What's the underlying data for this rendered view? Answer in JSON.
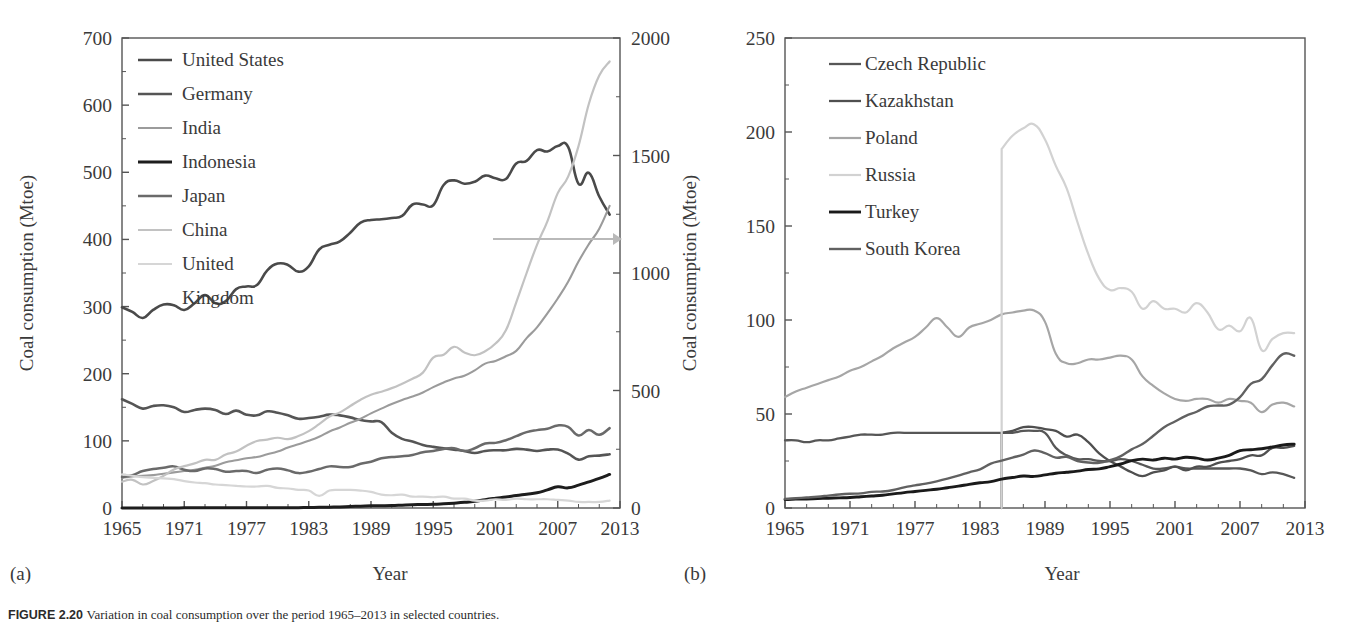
{
  "figure": {
    "caption_label": "FIGURE 2.20",
    "caption_text": "Variation in coal consumption over the period 1965–2013 in selected countries."
  },
  "panels": [
    {
      "id": "a",
      "letter": "(a)",
      "ylabel": "Coal consumption (Mtoe)",
      "xlabel": "Year",
      "y_ticks": [
        "0",
        "100",
        "200",
        "300",
        "400",
        "500",
        "600",
        "700"
      ],
      "y2_ticks": [
        "0",
        "500",
        "1000",
        "1500",
        "2000"
      ],
      "x_ticks": [
        "1965",
        "1971",
        "1977",
        "1983",
        "1989",
        "1995",
        "2001",
        "2007",
        "2013"
      ],
      "secondary_axis_arrow": "right-axis-arrow"
    },
    {
      "id": "b",
      "letter": "(b)",
      "ylabel": "Coal consumption (Mtoe)",
      "xlabel": "Year",
      "y_ticks": [
        "0",
        "50",
        "100",
        "150",
        "200",
        "250"
      ],
      "x_ticks": [
        "1965",
        "1971",
        "1977",
        "1983",
        "1989",
        "1995",
        "2001",
        "2007",
        "2013"
      ]
    }
  ],
  "chart_data": [
    {
      "type": "line",
      "panel": "a",
      "title": "",
      "xlabel": "Year",
      "ylabel": "Coal consumption (Mtoe)",
      "ylabel_secondary": "Coal consumption (Mtoe)",
      "xlim": [
        1965,
        2013
      ],
      "ylim": [
        0,
        700
      ],
      "ylim_secondary": [
        0,
        2000
      ],
      "y_ticks": [
        0,
        100,
        200,
        300,
        400,
        500,
        600,
        700
      ],
      "y2_ticks": [
        0,
        500,
        1000,
        1500,
        2000
      ],
      "x_ticks": [
        1965,
        1971,
        1977,
        1983,
        1989,
        1995,
        2001,
        2007,
        2013
      ],
      "grid": false,
      "legend_position": "upper-left",
      "annotation": {
        "text": "arrow to right axis",
        "y_left": 400,
        "x_from": 1994,
        "x_to": 2013
      },
      "x": [
        1965,
        1966,
        1967,
        1968,
        1969,
        1970,
        1971,
        1972,
        1973,
        1974,
        1975,
        1976,
        1977,
        1978,
        1979,
        1980,
        1981,
        1982,
        1983,
        1984,
        1985,
        1986,
        1987,
        1988,
        1989,
        1990,
        1991,
        1992,
        1993,
        1994,
        1995,
        1996,
        1997,
        1998,
        1999,
        2000,
        2001,
        2002,
        2003,
        2004,
        2005,
        2006,
        2007,
        2008,
        2009,
        2010,
        2011,
        2012
      ],
      "series": [
        {
          "name": "United States",
          "axis": "left",
          "color": "#4a4a4a",
          "width": 2.6,
          "values": [
            299,
            292,
            283,
            295,
            303,
            302,
            295,
            305,
            317,
            305,
            308,
            326,
            330,
            332,
            354,
            364,
            362,
            352,
            360,
            385,
            392,
            397,
            410,
            425,
            429,
            430,
            432,
            435,
            452,
            452,
            451,
            481,
            488,
            483,
            486,
            495,
            491,
            490,
            513,
            517,
            533,
            531,
            539,
            538,
            483,
            499,
            464,
            437
          ]
        },
        {
          "name": "Germany",
          "axis": "left",
          "color": "#555555",
          "width": 2.6,
          "values": [
            162,
            155,
            148,
            152,
            153,
            150,
            143,
            146,
            148,
            146,
            140,
            145,
            139,
            138,
            144,
            142,
            138,
            133,
            134,
            136,
            139,
            138,
            135,
            131,
            129,
            128,
            112,
            103,
            99,
            94,
            91,
            89,
            87,
            85,
            82,
            85,
            86,
            86,
            88,
            87,
            85,
            87,
            87,
            81,
            72,
            77,
            78,
            80
          ]
        },
        {
          "name": "India",
          "axis": "left",
          "color": "#9b9b9b",
          "width": 2.1,
          "values": [
            45,
            47,
            48,
            49,
            51,
            53,
            55,
            57,
            60,
            63,
            68,
            71,
            74,
            76,
            80,
            84,
            90,
            95,
            100,
            106,
            114,
            120,
            127,
            133,
            141,
            148,
            155,
            161,
            166,
            172,
            180,
            187,
            193,
            197,
            205,
            215,
            219,
            226,
            234,
            253,
            269,
            290,
            312,
            337,
            367,
            393,
            416,
            450
          ]
        },
        {
          "name": "Indonesia",
          "axis": "left",
          "color": "#1d1d1d",
          "width": 3.0,
          "values": [
            0.1,
            0.1,
            0.1,
            0.1,
            0.1,
            0.1,
            0.2,
            0.2,
            0.2,
            0.2,
            0.2,
            0.2,
            0.3,
            0.3,
            0.3,
            0.4,
            0.4,
            0.5,
            0.7,
            1.0,
            1.3,
            1.6,
            2.2,
            2.7,
            3.3,
            3.4,
            3.6,
            4.2,
            4.8,
            5.2,
            5.4,
            6.2,
            7.2,
            8.4,
            10.0,
            12.5,
            14.5,
            16.3,
            18.5,
            20.5,
            22.6,
            27.0,
            31.5,
            30.0,
            34.0,
            39.0,
            44.0,
            50.0
          ]
        },
        {
          "name": "Japan",
          "axis": "left",
          "color": "#6a6a6a",
          "width": 2.5,
          "values": [
            46,
            49,
            55,
            58,
            60,
            62,
            57,
            55,
            59,
            58,
            54,
            55,
            55,
            52,
            57,
            59,
            56,
            52,
            54,
            58,
            62,
            61,
            61,
            66,
            69,
            74,
            76,
            77,
            79,
            83,
            85,
            88,
            89,
            85,
            89,
            96,
            97,
            101,
            107,
            113,
            116,
            118,
            123,
            121,
            108,
            116,
            109,
            119
          ]
        },
        {
          "name": "China",
          "axis": "right",
          "color": "#c2c2c2",
          "width": 2.2,
          "values": [
            112,
            120,
            100,
            115,
            137,
            164,
            178,
            190,
            205,
            205,
            228,
            240,
            265,
            285,
            291,
            299,
            293,
            306,
            327,
            357,
            389,
            407,
            434,
            461,
            482,
            495,
            510,
            529,
            550,
            576,
            640,
            652,
            686,
            662,
            650,
            667,
            700,
            756,
            875,
            1000,
            1120,
            1220,
            1340,
            1410,
            1540,
            1720,
            1840,
            1900
          ]
        },
        {
          "name": "United Kingdom",
          "axis": "left",
          "color": "#d6d6d6",
          "width": 2.2,
          "values": [
            50,
            48,
            46,
            45,
            44,
            43,
            40,
            38,
            37,
            35,
            34,
            33,
            32,
            32,
            33,
            30,
            29,
            27,
            26,
            18,
            26,
            27,
            27,
            26,
            24,
            20,
            19,
            20,
            17,
            17,
            16,
            17,
            14,
            14,
            11,
            11,
            13,
            12,
            14,
            13,
            13,
            13,
            12,
            11,
            9,
            9,
            9,
            11
          ]
        }
      ]
    },
    {
      "type": "line",
      "panel": "b",
      "title": "",
      "xlabel": "Year",
      "ylabel": "Coal consumption (Mtoe)",
      "xlim": [
        1965,
        2013
      ],
      "ylim": [
        0,
        250
      ],
      "y_ticks": [
        0,
        50,
        100,
        150,
        200,
        250
      ],
      "x_ticks": [
        1965,
        1971,
        1977,
        1983,
        1989,
        1995,
        2001,
        2007,
        2013
      ],
      "grid": false,
      "legend_position": "upper-left",
      "x": [
        1965,
        1966,
        1967,
        1968,
        1969,
        1970,
        1971,
        1972,
        1973,
        1974,
        1975,
        1976,
        1977,
        1978,
        1979,
        1980,
        1981,
        1982,
        1983,
        1984,
        1985,
        1986,
        1987,
        1988,
        1989,
        1990,
        1991,
        1992,
        1993,
        1994,
        1995,
        1996,
        1997,
        1998,
        1999,
        2000,
        2001,
        2002,
        2003,
        2004,
        2005,
        2006,
        2007,
        2008,
        2009,
        2010,
        2011,
        2012
      ],
      "series": [
        {
          "name": "Czech Republic",
          "axis": "left",
          "color": "#575757",
          "width": 2.3,
          "values": [
            36,
            36,
            35,
            36,
            36,
            37,
            38,
            39,
            39,
            39,
            40,
            40,
            40,
            40,
            40,
            40,
            40,
            40,
            40,
            40,
            40,
            40,
            41,
            41,
            40,
            32,
            28,
            26,
            26,
            25,
            25,
            26,
            25,
            23,
            21,
            21,
            22,
            21,
            21,
            21,
            21,
            21,
            21,
            20,
            18,
            19,
            18,
            16
          ]
        },
        {
          "name": "Kazakhstan",
          "axis": "left",
          "color": "#4f4f4f",
          "width": 2.3,
          "values": [
            null,
            null,
            null,
            null,
            null,
            null,
            null,
            null,
            null,
            null,
            null,
            null,
            null,
            null,
            null,
            null,
            null,
            null,
            null,
            null,
            40,
            41,
            43,
            43,
            42,
            41,
            38,
            39,
            35,
            29,
            25,
            22,
            19,
            17,
            19,
            20,
            22,
            20,
            22,
            22,
            24,
            25,
            26,
            28,
            28,
            32,
            32,
            33
          ]
        },
        {
          "name": "Poland",
          "axis": "left",
          "color": "#a6a6a6",
          "width": 2.2,
          "values": [
            59,
            62,
            64,
            66,
            68,
            70,
            73,
            75,
            78,
            81,
            85,
            88,
            91,
            96,
            101,
            96,
            91,
            96,
            98,
            100,
            103,
            104,
            105,
            105,
            99,
            82,
            77,
            77,
            79,
            79,
            80,
            81,
            79,
            70,
            65,
            61,
            58,
            57,
            58,
            58,
            56,
            58,
            57,
            56,
            51,
            55,
            56,
            54
          ]
        },
        {
          "name": "Russia",
          "axis": "left",
          "color": "#d2d2d2",
          "width": 2.2,
          "values": [
            null,
            null,
            null,
            null,
            null,
            null,
            null,
            null,
            null,
            null,
            null,
            null,
            null,
            null,
            null,
            null,
            null,
            null,
            null,
            null,
            191,
            198,
            202,
            204,
            196,
            182,
            170,
            152,
            135,
            122,
            116,
            117,
            115,
            106,
            110,
            106,
            106,
            104,
            109,
            104,
            95,
            97,
            94,
            101,
            84,
            90,
            93,
            93
          ]
        },
        {
          "name": "Turkey",
          "axis": "left",
          "color": "#1a1a1a",
          "width": 2.9,
          "values": [
            4.5,
            4.7,
            4.8,
            5.0,
            5.2,
            5.4,
            5.6,
            6.0,
            6.4,
            6.8,
            7.5,
            8.2,
            8.8,
            9.4,
            10.0,
            10.8,
            11.6,
            12.6,
            13.4,
            14.0,
            15.4,
            16.2,
            17.0,
            16.8,
            17.6,
            18.5,
            19.0,
            19.6,
            20.5,
            20.8,
            22.0,
            23.4,
            25.2,
            26.0,
            25.5,
            26.5,
            26.0,
            27.0,
            26.5,
            25.5,
            26.5,
            28.0,
            30.5,
            31.0,
            31.5,
            32.5,
            33.5,
            34.0
          ]
        },
        {
          "name": "South Korea",
          "axis": "left",
          "color": "#616161",
          "width": 2.4,
          "values": [
            4.8,
            5.2,
            5.6,
            6.0,
            6.6,
            7.2,
            7.6,
            7.8,
            8.6,
            8.8,
            9.6,
            11.0,
            12.0,
            13.0,
            14.2,
            15.6,
            17.2,
            19.0,
            20.6,
            23.6,
            25.2,
            26.8,
            28.4,
            30.6,
            29.2,
            26.8,
            27.2,
            25.0,
            24.2,
            24.0,
            25.4,
            27.6,
            31.2,
            34.0,
            38.4,
            43.0,
            46.0,
            49.0,
            51.2,
            54.0,
            54.5,
            55.0,
            59.0,
            66.0,
            68.5,
            76.0,
            82.0,
            81.0
          ]
        }
      ]
    }
  ]
}
